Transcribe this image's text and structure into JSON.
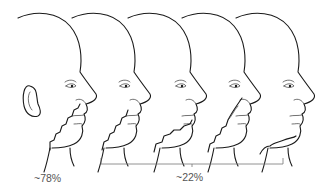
{
  "figure": {
    "title": "",
    "heads": [
      {
        "id": "head-1",
        "pattern": "type-1",
        "has_ear": true
      },
      {
        "id": "head-2",
        "pattern": "type-2",
        "has_ear": false
      },
      {
        "id": "head-3",
        "pattern": "type-3",
        "has_ear": false
      },
      {
        "id": "head-4",
        "pattern": "type-4",
        "has_ear": false
      },
      {
        "id": "head-5",
        "pattern": "type-5",
        "has_ear": false
      }
    ],
    "labels": {
      "left_percent": "~78%",
      "right_percent": "~22%"
    },
    "colors": {
      "line": "#1a1a1a",
      "bracket": "#777777",
      "text": "#555555",
      "background": "#ffffff"
    }
  }
}
